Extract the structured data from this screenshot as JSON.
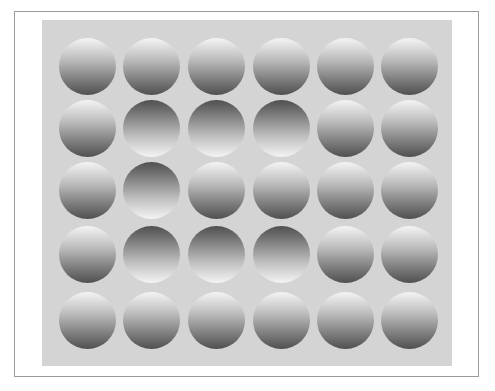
{
  "figure": {
    "rows": 5,
    "cols": 6,
    "colors": {
      "panel": "#d4d4d4",
      "light": "#f4f4f4",
      "dark": "#505050",
      "frame": "#9a9a9a"
    },
    "grid": [
      [
        "up",
        "up",
        "up",
        "up",
        "up",
        "up"
      ],
      [
        "up",
        "down",
        "down",
        "down",
        "up",
        "up"
      ],
      [
        "up",
        "down",
        "up",
        "up",
        "up",
        "up"
      ],
      [
        "up",
        "down",
        "down",
        "down",
        "up",
        "up"
      ],
      [
        "up",
        "up",
        "up",
        "up",
        "up",
        "up"
      ]
    ],
    "col_centers": [
      87,
      151,
      216,
      281,
      345,
      409
    ],
    "row_centers": [
      66,
      128,
      190,
      254,
      320
    ]
  }
}
